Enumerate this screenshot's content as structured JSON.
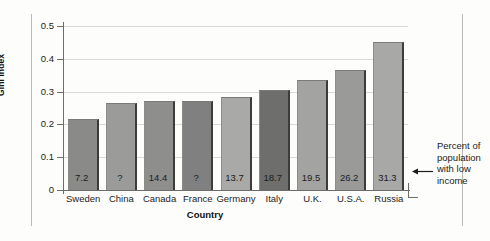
{
  "chart_data": {
    "type": "bar",
    "title": "",
    "xlabel": "Country",
    "ylabel": "Gini index",
    "ylim": [
      0,
      0.5
    ],
    "yticks": [
      0,
      0.1,
      0.2,
      0.3,
      0.4,
      0.5
    ],
    "ytick_labels": [
      "0",
      "0.1",
      "0.2",
      "0.3",
      "0.4",
      "0.5"
    ],
    "grid": true,
    "legend": "none",
    "categories": [
      "Sweden",
      "China",
      "Canada",
      "France",
      "Germany",
      "Italy",
      "U.K.",
      "U.S.A.",
      "Russia"
    ],
    "values": [
      0.215,
      0.265,
      0.272,
      0.272,
      0.283,
      0.305,
      0.335,
      0.365,
      0.452
    ],
    "bar_labels": [
      "7.2",
      "?",
      "14.4",
      "?",
      "13.7",
      "18.7",
      "19.5",
      "26.2",
      "31.3"
    ],
    "bar_label_meaning": "Percent of population with low income",
    "bar_colors": [
      "#8a8a88",
      "#9b9b99",
      "#8e8e8c",
      "#808080",
      "#a9a9a7",
      "#6e6e6c",
      "#a3a3a1",
      "#9a9a98",
      "#a8a8a6"
    ],
    "annotation": {
      "text": "Percent of population with low income",
      "lines": [
        "Percent of",
        "population",
        "with low",
        "income"
      ],
      "arrow": "left-arrow-icon"
    }
  },
  "axis": {
    "y_label": "Gini index",
    "x_label": "Country"
  }
}
